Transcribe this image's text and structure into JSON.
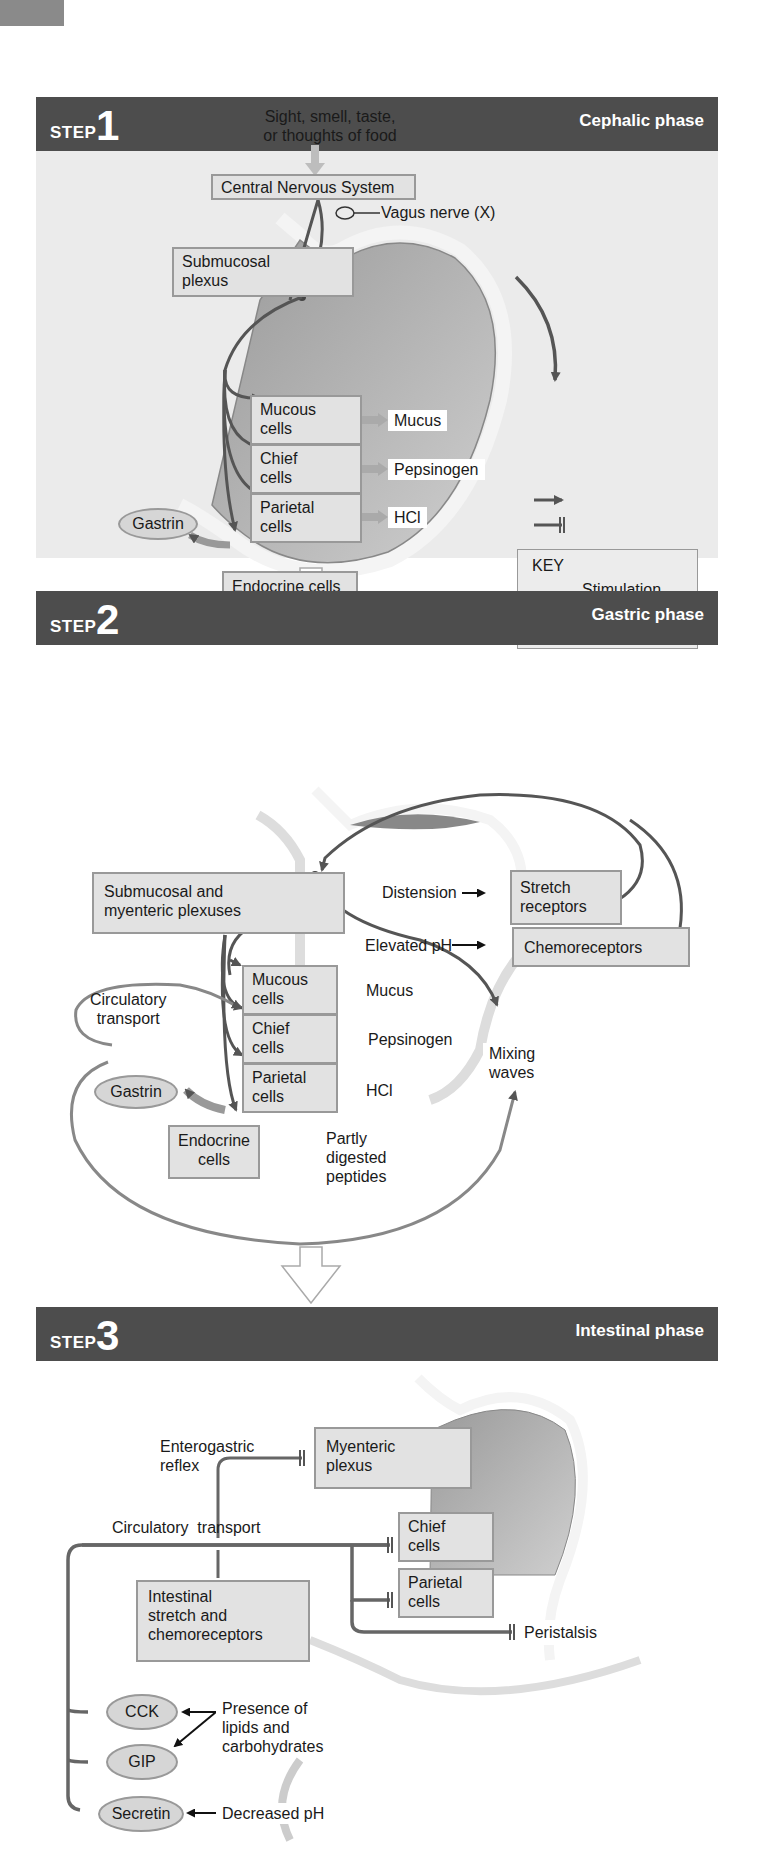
{
  "step1": {
    "step_word": "STEP",
    "step_number": "1",
    "phase": "Cephalic phase",
    "stimulus_line1": "Sight, smell, taste,",
    "stimulus_line2": "or thoughts of food",
    "cns": "Central Nervous System",
    "vagus": "Vagus nerve (X)",
    "submucosal": [
      "Submucosal",
      "plexus"
    ],
    "cells": [
      {
        "line1": "Mucous",
        "line2": "cells",
        "product": "Mucus"
      },
      {
        "line1": "Chief",
        "line2": "cells",
        "product": "Pepsinogen"
      },
      {
        "line1": "Parietal",
        "line2": "cells",
        "product": "HCl"
      }
    ],
    "gastrin": "Gastrin",
    "endocrine": "Endocrine cells",
    "key": {
      "title": "KEY",
      "stimulation": "Stimulation",
      "inhibition": "Inhibition"
    }
  },
  "step2": {
    "step_word": "STEP",
    "step_number": "2",
    "phase": "Gastric phase",
    "plexuses": [
      "Submucosal and",
      "myenteric plexuses"
    ],
    "distension": "Distension",
    "stretch": [
      "Stretch",
      "receptors"
    ],
    "elevated_ph": "Elevated pH",
    "chemoreceptors": "Chemoreceptors",
    "circulatory": [
      "Circulatory",
      "transport"
    ],
    "cells": [
      {
        "line1": "Mucous",
        "line2": "cells",
        "product": "Mucus"
      },
      {
        "line1": "Chief",
        "line2": "cells",
        "product": "Pepsinogen"
      },
      {
        "line1": "Parietal",
        "line2": "cells",
        "product": "HCl"
      }
    ],
    "mixing": [
      "Mixing",
      "waves"
    ],
    "gastrin": "Gastrin",
    "endocrine": [
      "Endocrine",
      "cells"
    ],
    "peptides": [
      "Partly",
      "digested",
      "peptides"
    ]
  },
  "step3": {
    "step_word": "STEP",
    "step_number": "3",
    "phase": "Intestinal phase",
    "enterogastric": [
      "Enterogastric",
      "reflex"
    ],
    "myenteric": [
      "Myenteric",
      "plexus"
    ],
    "circulatory": "Circulatory  transport",
    "chief": [
      "Chief",
      "cells"
    ],
    "parietal": [
      "Parietal",
      "cells"
    ],
    "peristalsis": "Peristalsis",
    "intestinal": [
      "Intestinal",
      "stretch and",
      "chemoreceptors"
    ],
    "hormones": [
      "CCK",
      "GIP",
      "Secretin"
    ],
    "lipids": [
      "Presence of",
      "lipids and",
      "carbohydrates"
    ],
    "decreased_ph": "Decreased pH"
  },
  "colors": {
    "header": "#4d4d4d",
    "panel": "#ebebeb",
    "box_fill": "#e2e2e2",
    "box_border": "#999999",
    "arrow": "#555555"
  }
}
